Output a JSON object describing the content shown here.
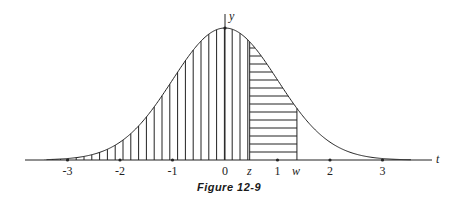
{
  "figure": {
    "caption": "Figure 12-9",
    "axis_labels": {
      "x": "t",
      "y": "y"
    },
    "tick_labels": [
      "-3",
      "-2",
      "-1",
      "0",
      "1",
      "2",
      "3"
    ],
    "tick_values": [
      -3,
      -2,
      -1,
      0,
      1,
      2,
      3
    ],
    "markers": {
      "z_label": "z",
      "w_label": "w",
      "z_value": 0.47,
      "w_value": 1.37
    }
  },
  "chart_data": {
    "type": "area",
    "title": "Figure 12-9",
    "xlabel": "t",
    "ylabel": "y",
    "xlim": [
      -3.8,
      3.9
    ],
    "x_ticks": [
      -3,
      -2,
      -1,
      0,
      1,
      2,
      3
    ],
    "curve": "y = exp(-t^2/2)/sqrt(2*pi)",
    "regions": [
      {
        "name": "vertical-hatch",
        "from": "-inf",
        "to": "z"
      },
      {
        "name": "horizontal-hatch",
        "from": "z",
        "to": "w"
      }
    ],
    "annotations": [
      "z",
      "w"
    ],
    "grid": false
  }
}
